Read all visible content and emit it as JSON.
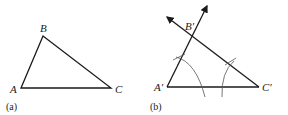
{
  "panel_a": {
    "caption": "(a)",
    "vertices": {
      "A": "A",
      "B": "B",
      "C": "C"
    }
  },
  "panel_b": {
    "caption": "(b)",
    "vertices": {
      "A": "A′",
      "B": "B′",
      "C": "C′"
    }
  }
}
